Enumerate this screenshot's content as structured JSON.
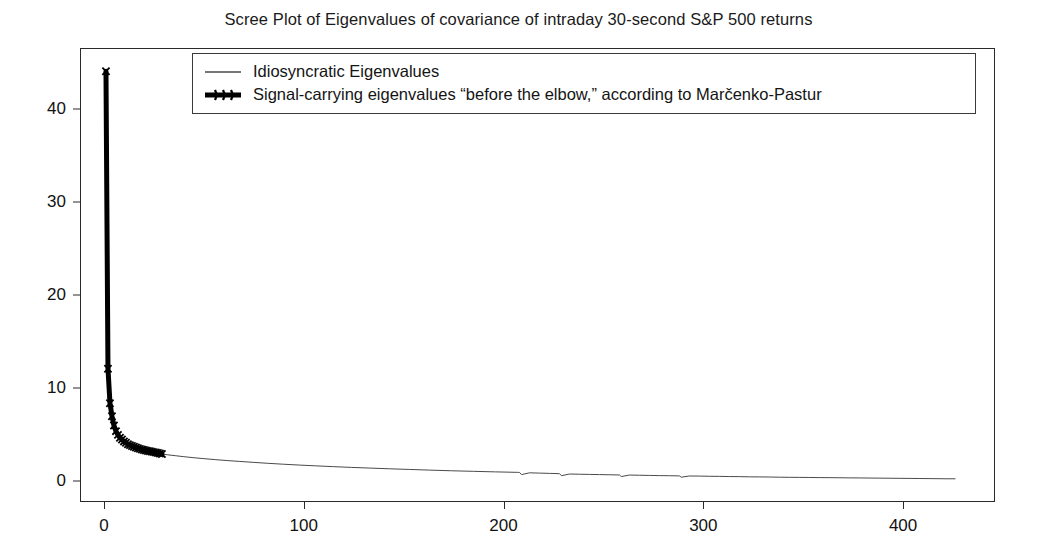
{
  "figure": {
    "width": 1037,
    "height": 556,
    "background": "#ffffff"
  },
  "chart_data": {
    "type": "line",
    "title": "Scree Plot of Eigenvalues of covariance of intraday 30-second S&P 500 returns",
    "xlabel": "",
    "ylabel": "",
    "xlim": [
      -12,
      446
    ],
    "ylim": [
      -2.2,
      46.5
    ],
    "xticks": [
      0,
      100,
      200,
      300,
      400
    ],
    "xtick_labels": [
      "0",
      "100",
      "200",
      "300",
      "400"
    ],
    "yticks": [
      0,
      10,
      20,
      30,
      40
    ],
    "ytick_labels": [
      "0",
      "10",
      "20",
      "30",
      "40"
    ],
    "grid": false,
    "legend_position": "upper center",
    "legend": [
      {
        "name": "Idiosyncratic Eigenvalues",
        "style": "thin-line",
        "color": "#4a4a4a",
        "linewidth": 1
      },
      {
        "name": "Signal-carrying eigenvalues “before the elbow,” according to Marčenko-Pastur",
        "style": "thick-line-with-markers",
        "color": "#000000",
        "linewidth": 5
      }
    ],
    "series": [
      {
        "name": "Idiosyncratic Eigenvalues",
        "color": "#4a4a4a",
        "linewidth": 1,
        "x": [
          29,
          32,
          36,
          40,
          45,
          50,
          56,
          62,
          68,
          75,
          82,
          90,
          98,
          106,
          115,
          124,
          133,
          143,
          153,
          163,
          174,
          185,
          196,
          207,
          208,
          209,
          213,
          218,
          223,
          228,
          229,
          233,
          238,
          243,
          248,
          253,
          258,
          259,
          263,
          268,
          273,
          278,
          283,
          288,
          289,
          293,
          298,
          303,
          308,
          313,
          318,
          323,
          328,
          333,
          338,
          343,
          348,
          353,
          358,
          363,
          368,
          373,
          378,
          383,
          388,
          393,
          398,
          403,
          408,
          413,
          418,
          422,
          426
        ],
        "y": [
          2.95,
          2.86,
          2.76,
          2.66,
          2.55,
          2.45,
          2.34,
          2.24,
          2.15,
          2.05,
          1.95,
          1.85,
          1.76,
          1.68,
          1.59,
          1.51,
          1.44,
          1.36,
          1.29,
          1.22,
          1.15,
          1.09,
          1.03,
          0.98,
          0.97,
          0.74,
          0.93,
          0.9,
          0.87,
          0.84,
          0.62,
          0.8,
          0.78,
          0.76,
          0.74,
          0.72,
          0.7,
          0.53,
          0.69,
          0.67,
          0.65,
          0.63,
          0.62,
          0.6,
          0.46,
          0.59,
          0.58,
          0.56,
          0.55,
          0.53,
          0.52,
          0.5,
          0.49,
          0.48,
          0.46,
          0.45,
          0.44,
          0.43,
          0.42,
          0.41,
          0.4,
          0.39,
          0.38,
          0.37,
          0.36,
          0.35,
          0.34,
          0.33,
          0.32,
          0.31,
          0.3,
          0.29,
          0.29
        ]
      },
      {
        "name": "Signal-carrying eigenvalues “before the elbow,” according to Marčenko-Pastur",
        "color": "#000000",
        "linewidth": 5,
        "x": [
          1,
          2,
          3,
          4,
          5,
          6,
          7,
          8,
          9,
          10,
          11,
          12,
          13,
          14,
          15,
          16,
          17,
          18,
          19,
          20,
          21,
          22,
          23,
          24,
          25,
          26,
          27,
          28,
          29
        ],
        "y": [
          44.0,
          12.1,
          8.4,
          7.0,
          6.0,
          5.4,
          5.0,
          4.7,
          4.5,
          4.3,
          4.15,
          4.0,
          3.9,
          3.8,
          3.72,
          3.64,
          3.56,
          3.5,
          3.44,
          3.38,
          3.33,
          3.28,
          3.24,
          3.2,
          3.15,
          3.1,
          3.06,
          3.0,
          2.95
        ]
      }
    ]
  }
}
